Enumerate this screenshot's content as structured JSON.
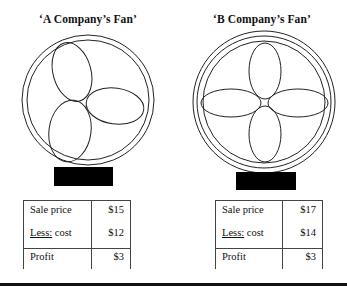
{
  "fans": [
    {
      "title": "‘A Company’s Fan’",
      "blades": 3,
      "rings": 2,
      "table": {
        "rows": [
          {
            "label": "Sale price",
            "label_prefix": "",
            "value": "$15"
          },
          {
            "label": " cost",
            "label_prefix": "Less:",
            "value": "$12"
          },
          {
            "label": "Profit",
            "label_prefix": "",
            "value": "$3"
          }
        ]
      }
    },
    {
      "title": "‘B Company’s Fan’",
      "blades": 4,
      "rings": 3,
      "table": {
        "rows": [
          {
            "label": "Sale price",
            "label_prefix": "",
            "value": "$17"
          },
          {
            "label": " cost",
            "label_prefix": "Less:",
            "value": "$14"
          },
          {
            "label": "Profit",
            "label_prefix": "",
            "value": "$3"
          }
        ]
      }
    }
  ],
  "colors": {
    "line": "#222222",
    "stand": "#000000",
    "background": "#ffffff"
  }
}
